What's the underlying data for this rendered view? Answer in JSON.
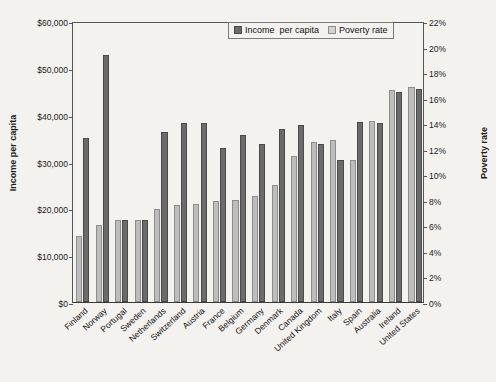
{
  "chart_data": {
    "type": "bar",
    "title": "",
    "subtitle": "",
    "xlabel": "",
    "ylabel": "Income per capita",
    "y2label": "Poverty rate",
    "grid": false,
    "legend_position": "top-right",
    "ylim": [
      0,
      60000
    ],
    "y2lim": [
      0,
      22
    ],
    "yticks": [
      "$0",
      "$10,000",
      "$20,000",
      "$30,000",
      "$40,000",
      "$50,000",
      "$60,000"
    ],
    "y2ticks": [
      "0%",
      "2%",
      "4%",
      "6%",
      "8%",
      "10%",
      "12%",
      "14%",
      "16%",
      "18%",
      "20%",
      "22%"
    ],
    "categories": [
      "Finland",
      "Norway",
      "Portugal",
      "Sweden",
      "Netherlands",
      "Switzerland",
      "Austria",
      "France",
      "Belgium",
      "Germany",
      "Denmark",
      "Canada",
      "United Kingdom",
      "Italy",
      "Spain",
      "Australia",
      "Ireland",
      "United States"
    ],
    "series": [
      {
        "name": "Income  per capita",
        "axis": "left",
        "unit": "USD",
        "color": "#6b6b6b",
        "values": [
          35000,
          52800,
          17500,
          17500,
          36300,
          38300,
          38300,
          32800,
          35600,
          33800,
          37000,
          37700,
          33700,
          30400,
          38500,
          38300,
          44900,
          45400
        ]
      },
      {
        "name": "Poverty rate",
        "axis": "right",
        "unit": "percent",
        "color": "#bdbdbd",
        "values": [
          5.2,
          6.0,
          6.4,
          6.4,
          7.3,
          7.6,
          7.7,
          7.9,
          8.0,
          8.3,
          9.2,
          11.4,
          12.5,
          12.7,
          11.1,
          14.2,
          16.6,
          16.8
        ]
      }
    ]
  }
}
